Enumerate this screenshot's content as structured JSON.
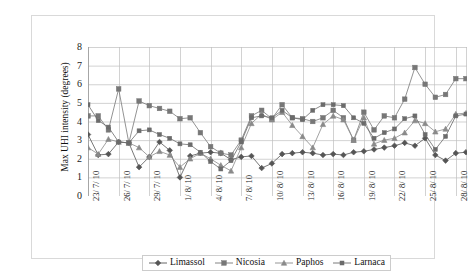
{
  "chart_data": {
    "type": "line",
    "title": "",
    "xlabel": "",
    "ylabel": "Max UHI intensity (degrees)",
    "ylim": [
      0,
      8
    ],
    "yticks": [
      0,
      1,
      2,
      3,
      4,
      5,
      6,
      7,
      8
    ],
    "grid": true,
    "legend_position": "bottom",
    "categories": [
      "23/ 7/ 10",
      "24/ 7/ 10",
      "25/ 7/ 10",
      "26/ 7/ 10",
      "27/ 7/ 10",
      "28/ 7/ 10",
      "29/ 7/ 10",
      "30/ 7/ 10",
      "31/ 7/ 10",
      "1/ 8/ 10",
      "2/ 8/ 10",
      "3/ 8/ 10",
      "4/ 8/ 10",
      "5/ 8/ 10",
      "6/ 8/ 10",
      "7/ 8/ 10",
      "8/ 8/ 10",
      "9/ 8/ 10",
      "10/ 8/ 10",
      "11/ 8/ 10",
      "12/ 8/ 10",
      "13/ 8/ 10",
      "14/ 8/ 10",
      "15/ 8/ 10",
      "16/ 8/ 10",
      "17/ 8/ 10",
      "18/ 8/ 10",
      "19/ 8/ 10",
      "20/ 8/ 10",
      "21/ 8/ 10",
      "22/ 8/ 10",
      "23/ 8/ 10",
      "24/ 8/ 10",
      "25/ 8/ 10",
      "26/ 8/ 10",
      "27/ 8/ 10",
      "28/ 8/ 10",
      "29/ 8/ 10"
    ],
    "xtick_labels": [
      "23/ 7/ 10",
      "26/ 7/ 10",
      "29/ 7/ 10",
      "1/ 8/ 10",
      "4/ 8/ 10",
      "7/ 8/ 10",
      "10/ 8/ 10",
      "13/ 8/ 10",
      "16/ 8/ 10",
      "19/ 8/ 10",
      "22/ 8/ 10",
      "25/ 8/ 10",
      "28/ 8/ 10"
    ],
    "xtick_indices": [
      0,
      3,
      6,
      9,
      12,
      15,
      18,
      21,
      24,
      27,
      30,
      33,
      36
    ],
    "series": [
      {
        "name": "Limassol",
        "marker": "diamond",
        "color": "#555555",
        "values": [
          3.3,
          2.2,
          2.25,
          2.9,
          2.85,
          1.55,
          2.1,
          2.9,
          2.45,
          1.0,
          2.15,
          2.3,
          2.35,
          2.3,
          1.95,
          2.1,
          2.15,
          1.5,
          1.75,
          2.25,
          2.3,
          2.35,
          2.3,
          2.2,
          2.25,
          2.2,
          2.35,
          2.4,
          2.5,
          2.6,
          2.7,
          2.85,
          2.7,
          3.1,
          2.2,
          1.9,
          2.3,
          2.35
        ]
      },
      {
        "name": "Nicosia",
        "marker": "square",
        "color": "#777777",
        "values": [
          4.3,
          4.3,
          3.55,
          5.75,
          2.85,
          5.1,
          4.85,
          4.7,
          4.55,
          4.15,
          4.2,
          3.4,
          2.65,
          2.3,
          2.2,
          3.0,
          4.3,
          4.6,
          4.15,
          4.9,
          4.2,
          4.15,
          4.0,
          4.2,
          4.6,
          4.2,
          3.0,
          4.5,
          3.55,
          4.3,
          4.2,
          5.2,
          6.9,
          6.0,
          5.3,
          5.45,
          6.3,
          6.3
        ]
      },
      {
        "name": "Paphos",
        "marker": "triangle",
        "color": "#8a8a8a",
        "values": [
          2.6,
          2.25,
          3.05,
          2.9,
          2.85,
          2.6,
          2.1,
          2.4,
          2.2,
          1.55,
          2.0,
          2.3,
          2.0,
          1.65,
          1.35,
          2.6,
          3.9,
          4.4,
          4.1,
          4.5,
          3.8,
          3.2,
          2.6,
          3.85,
          4.3,
          4.1,
          3.0,
          4.2,
          2.8,
          3.0,
          3.1,
          3.4,
          4.05,
          3.9,
          3.45,
          3.6,
          4.4,
          4.45
        ]
      },
      {
        "name": "Larnaca",
        "marker": "square-small",
        "color": "#6b6b6b",
        "values": [
          4.9,
          4.05,
          3.7,
          2.9,
          2.85,
          3.5,
          3.55,
          3.3,
          3.1,
          2.8,
          2.75,
          2.35,
          1.85,
          1.45,
          1.9,
          2.9,
          4.2,
          4.3,
          4.2,
          4.6,
          4.2,
          4.1,
          4.6,
          4.9,
          4.9,
          4.85,
          4.2,
          3.9,
          3.1,
          3.4,
          3.6,
          4.15,
          4.3,
          3.3,
          2.5,
          3.2,
          4.3,
          4.4
        ]
      }
    ]
  },
  "legend": {
    "items": [
      {
        "label": "Limassol"
      },
      {
        "label": "Nicosia"
      },
      {
        "label": "Paphos"
      },
      {
        "label": "Larnaca"
      }
    ]
  }
}
